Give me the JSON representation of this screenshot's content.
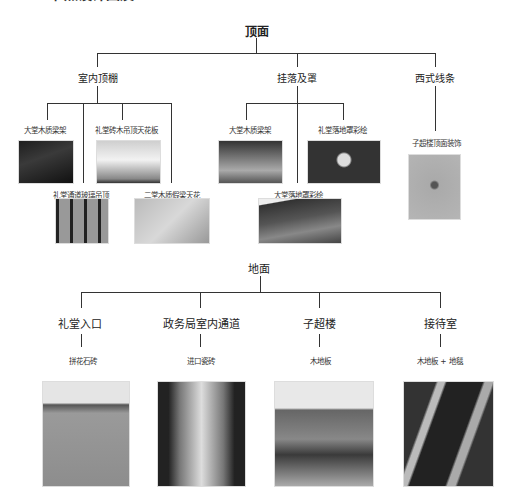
{
  "caption_partial": "节点设计图及……",
  "ceiling": {
    "title": "顶面",
    "branches": [
      {
        "label": "室内顶棚",
        "items": [
          {
            "label": "大堂木质梁架",
            "photo": "dark-wood-beams"
          },
          {
            "label": "礼堂砖木吊顶天花板",
            "photo": "white-ceiling"
          },
          {
            "label": "礼堂通道玻璃吊顶",
            "photo": "glass-ceiling"
          },
          {
            "label": "二堂木质假梁天花",
            "photo": "plain-ceiling"
          }
        ]
      },
      {
        "label": "挂落及罩",
        "items": [
          {
            "label": "大堂木质梁架",
            "photo": "wood-hanging"
          },
          {
            "label": "礼堂落地罩彩绘",
            "photo": "painted-cover"
          },
          {
            "label": "大堂落地罩彩绘",
            "photo": "floor-cover"
          }
        ]
      },
      {
        "label": "西式线条",
        "items": [
          {
            "label": "子超楼顶面装饰",
            "photo": "western-ceiling"
          }
        ]
      }
    ]
  },
  "floor": {
    "title": "地面",
    "branches": [
      {
        "label": "礼堂入口",
        "material": "拼花石砖",
        "photo": "stone-floor"
      },
      {
        "label": "政务局室内通道",
        "material": "进口瓷砖",
        "photo": "corridor"
      },
      {
        "label": "子超楼",
        "material": "木地板",
        "photo": "room"
      },
      {
        "label": "接待室",
        "material": "木地板 + 地毯",
        "photo": "carpet"
      }
    ]
  }
}
